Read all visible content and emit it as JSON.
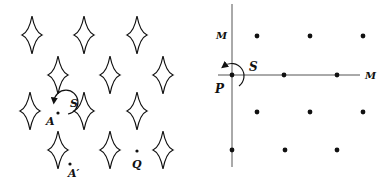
{
  "left_panel": {
    "diamonds": [
      {
        "x": 32,
        "y": 35
      },
      {
        "x": 84,
        "y": 35
      },
      {
        "x": 137,
        "y": 35
      },
      {
        "x": 58,
        "y": 75
      },
      {
        "x": 110,
        "y": 75
      },
      {
        "x": 163,
        "y": 75
      },
      {
        "x": 30,
        "y": 111
      },
      {
        "x": 84,
        "y": 111
      },
      {
        "x": 137,
        "y": 111
      },
      {
        "x": 58,
        "y": 150
      },
      {
        "x": 110,
        "y": 150
      },
      {
        "x": 163,
        "y": 150
      }
    ],
    "labels": {
      "S": "S",
      "A": "A",
      "A_prime": "A′",
      "Q": "Q"
    }
  },
  "right_panel": {
    "dots": [
      {
        "x": 257,
        "y": 36
      },
      {
        "x": 310,
        "y": 36
      },
      {
        "x": 363,
        "y": 36
      },
      {
        "x": 232,
        "y": 75
      },
      {
        "x": 284,
        "y": 75
      },
      {
        "x": 337,
        "y": 75
      },
      {
        "x": 257,
        "y": 112
      },
      {
        "x": 310,
        "y": 112
      },
      {
        "x": 363,
        "y": 112
      },
      {
        "x": 232,
        "y": 150
      },
      {
        "x": 285,
        "y": 150
      },
      {
        "x": 337,
        "y": 150
      }
    ],
    "labels": {
      "M_vertical": "M",
      "M_horizontal": "M",
      "S": "S",
      "P": "P"
    }
  },
  "colors": {
    "ink": "#111111",
    "axis": "#555555",
    "background": "#ffffff"
  }
}
